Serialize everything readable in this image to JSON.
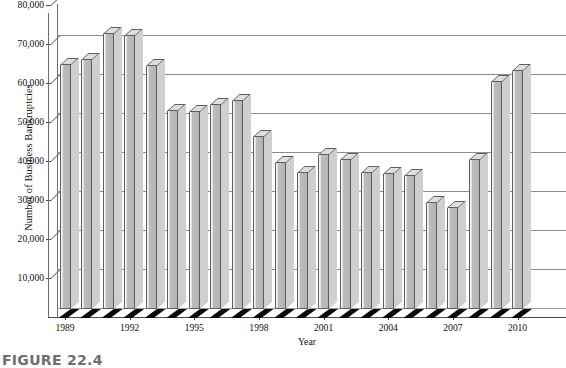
{
  "chart_data": {
    "type": "bar",
    "title": "",
    "xlabel": "Year",
    "ylabel": "Number of Business Bankruptcies",
    "ylim": [
      0,
      80000
    ],
    "ytick_labels": [
      "80,000",
      "70,000",
      "60,000",
      "50,000",
      "40,000",
      "30,000",
      "20,000",
      "10,000"
    ],
    "ytick_values": [
      80000,
      70000,
      60000,
      50000,
      40000,
      30000,
      20000,
      10000
    ],
    "xtick_labels": [
      "1989",
      "1992",
      "1995",
      "1998",
      "2001",
      "2004",
      "2007",
      "2010"
    ],
    "grid": true,
    "legend": "none",
    "style": "3d-column",
    "categories": [
      "1989",
      "1990",
      "1991",
      "1992",
      "1993",
      "1994",
      "1995",
      "1996",
      "1997",
      "1998",
      "1999",
      "2000",
      "2001",
      "2002",
      "2003",
      "2004",
      "2005",
      "2006",
      "2007",
      "2008",
      "2009",
      "2010"
    ],
    "values": [
      62500,
      63800,
      70600,
      69900,
      62400,
      50800,
      50500,
      52300,
      53400,
      44000,
      37400,
      35000,
      39500,
      38300,
      35000,
      34700,
      34200,
      27300,
      26000,
      38300,
      58300,
      61000
    ],
    "series": [
      {
        "name": "Number of Business Bankruptcies",
        "values": [
          62500,
          63800,
          70600,
          69900,
          62400,
          50800,
          50500,
          52300,
          53400,
          44000,
          37400,
          35000,
          39500,
          38300,
          35000,
          34700,
          34200,
          27300,
          26000,
          38300,
          58300,
          61000
        ]
      }
    ]
  },
  "caption": {
    "figure_label": "FIGURE 22.4"
  },
  "colors": {
    "bar_fill": "#b4b4b4",
    "bar_top": "#dedede",
    "bar_outline": "#5e5e5e",
    "gridline": "#8d8d8d",
    "shadow": "#0a0a0a",
    "text": "#111111",
    "caption": "#6f6f6f"
  }
}
